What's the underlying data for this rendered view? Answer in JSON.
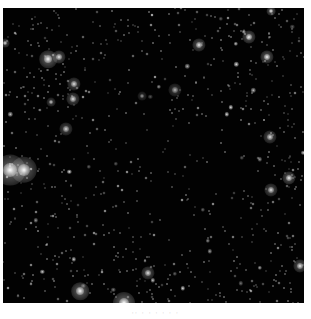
{
  "image": {
    "subject": "star field",
    "background_color": "#020202",
    "star_color": "#ffffff",
    "bright_stars": [
      {
        "x": 7,
        "y": 162,
        "r": 7,
        "b": 1.0
      },
      {
        "x": 21,
        "y": 162,
        "r": 6,
        "b": 0.95
      },
      {
        "x": 45,
        "y": 51,
        "r": 4,
        "b": 0.95
      },
      {
        "x": 56,
        "y": 49,
        "r": 3,
        "b": 0.85
      },
      {
        "x": 71,
        "y": 76,
        "r": 3,
        "b": 0.8
      },
      {
        "x": 70,
        "y": 91,
        "r": 3,
        "b": 0.8
      },
      {
        "x": 77,
        "y": 283,
        "r": 4,
        "b": 0.95
      },
      {
        "x": 121,
        "y": 295,
        "r": 5,
        "b": 1.0
      },
      {
        "x": 145,
        "y": 265,
        "r": 3,
        "b": 0.8
      },
      {
        "x": 172,
        "y": 82,
        "r": 3,
        "b": 0.6
      },
      {
        "x": 139,
        "y": 88,
        "r": 2,
        "b": 0.5
      },
      {
        "x": 246,
        "y": 29,
        "r": 3,
        "b": 0.9
      },
      {
        "x": 264,
        "y": 49,
        "r": 3,
        "b": 0.9
      },
      {
        "x": 196,
        "y": 37,
        "r": 3,
        "b": 0.85
      },
      {
        "x": 267,
        "y": 129,
        "r": 3,
        "b": 0.8
      },
      {
        "x": 286,
        "y": 170,
        "r": 3,
        "b": 0.9
      },
      {
        "x": 268,
        "y": 182,
        "r": 3,
        "b": 0.8
      },
      {
        "x": 297,
        "y": 258,
        "r": 3,
        "b": 0.85
      },
      {
        "x": 48,
        "y": 94,
        "r": 2,
        "b": 0.7
      },
      {
        "x": 63,
        "y": 121,
        "r": 3,
        "b": 0.75
      },
      {
        "x": 2,
        "y": 35,
        "r": 2,
        "b": 0.8
      },
      {
        "x": 268,
        "y": 3,
        "r": 2,
        "b": 0.9
      }
    ],
    "faint_star_count": 900,
    "dark_region": {
      "cx": 165,
      "cy": 150,
      "rx": 90,
      "ry": 105
    }
  },
  "caption": {
    "text": "·· · · · · · ·"
  }
}
